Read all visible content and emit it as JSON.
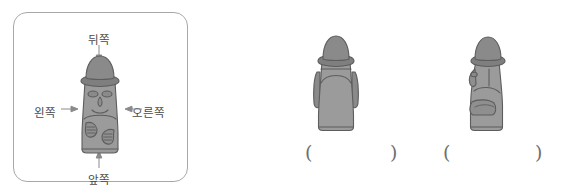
{
  "page": {
    "type": "worksheet-illustration",
    "language": "ko",
    "background_color": "#ffffff"
  },
  "reference_panel": {
    "name": "direction-reference-box",
    "border_color": "#a8a8a8",
    "subject": "dol-hareubang-stone-statue",
    "view": "front",
    "labels": {
      "back": "뒤쪽",
      "front": "앞쪽",
      "left": "왼쪽",
      "right": "오른쪽"
    },
    "arrows": [
      {
        "name": "arrow-back",
        "direction": "down",
        "points_to": "statue"
      },
      {
        "name": "arrow-front",
        "direction": "up",
        "points_to": "statue"
      },
      {
        "name": "arrow-left",
        "direction": "right",
        "points_to": "statue"
      },
      {
        "name": "arrow-right",
        "direction": "left",
        "points_to": "statue"
      }
    ]
  },
  "questions": [
    {
      "id": 1,
      "figure": {
        "name": "statue-back-view",
        "view": "back",
        "description": "dol hareubang seen from behind, no face visible"
      },
      "answer_blank": {
        "open": "(",
        "close": ")",
        "value": ""
      }
    },
    {
      "id": 2,
      "figure": {
        "name": "statue-side-view",
        "view": "side",
        "facing": "left",
        "description": "dol hareubang seen in profile facing left"
      },
      "answer_blank": {
        "open": "(",
        "close": ")",
        "value": ""
      }
    }
  ],
  "colors": {
    "stone_light": "#9b9b9b",
    "stone_mid": "#8f8f8f",
    "stone_dark": "#7f7f7f",
    "outline": "#5d5d5d",
    "text": "#4a4a4a",
    "border": "#a8a8a8"
  }
}
